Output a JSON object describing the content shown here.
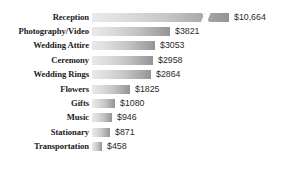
{
  "chart_data": {
    "type": "bar",
    "orientation": "horizontal",
    "title": "",
    "xlabel": "",
    "ylabel": "",
    "grid": false,
    "legend": null,
    "axis_break": {
      "series_index": 0,
      "category": "Reception",
      "note": "bar drawn with a break (zigzag) mark indicating truncated length"
    },
    "categories": [
      "Reception",
      "Photography/Video",
      "Wedding Attire",
      "Ceremony",
      "Wedding Rings",
      "Flowers",
      "Gifts",
      "Music",
      "Stationary",
      "Transportation"
    ],
    "values": [
      10664,
      3821,
      3053,
      2958,
      2864,
      1825,
      1080,
      946,
      871,
      458
    ],
    "value_labels": [
      "$10,664",
      "$3821",
      "$3053",
      "$2958",
      "$2864",
      "$1825",
      "$1080",
      "$946",
      "$871",
      "$458"
    ],
    "bar_pixel_widths": [
      137,
      78,
      63,
      61,
      59,
      38,
      23,
      20,
      18,
      10
    ],
    "xlim": [
      0,
      10664
    ],
    "colors": {
      "bar_gradient_start": "#e9e9e9",
      "bar_gradient_end": "#949494",
      "label_text": "#1a1a1a",
      "value_text": "#2b2b2b",
      "background": "#ffffff"
    }
  },
  "rows": [
    {
      "label": "Reception",
      "value_label": "$10,664",
      "width": 137,
      "break": true
    },
    {
      "label": "Photography/Video",
      "value_label": "$3821",
      "width": 78,
      "break": false
    },
    {
      "label": "Wedding Attire",
      "value_label": "$3053",
      "width": 63,
      "break": false
    },
    {
      "label": "Ceremony",
      "value_label": "$2958",
      "width": 61,
      "break": false
    },
    {
      "label": "Wedding Rings",
      "value_label": "$2864",
      "width": 59,
      "break": false
    },
    {
      "label": "Flowers",
      "value_label": "$1825",
      "width": 38,
      "break": false
    },
    {
      "label": "Gifts",
      "value_label": "$1080",
      "width": 23,
      "break": false
    },
    {
      "label": "Music",
      "value_label": "$946",
      "width": 20,
      "break": false
    },
    {
      "label": "Stationary",
      "value_label": "$871",
      "width": 18,
      "break": false
    },
    {
      "label": "Transportation",
      "value_label": "$458",
      "width": 10,
      "break": false
    }
  ]
}
